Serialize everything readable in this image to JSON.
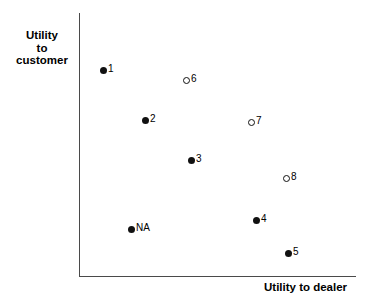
{
  "figure": {
    "background_color": "#ffffff",
    "axis_color": "#4a4a4a",
    "marker_color": "#111111",
    "width": 367,
    "height": 305
  },
  "axes": {
    "y_title_lines": [
      "Utility",
      "to",
      "customer"
    ],
    "x_title": "Utility to dealer"
  },
  "chart_data": {
    "type": "scatter",
    "title": "",
    "xlabel": "Utility to dealer",
    "ylabel": "Utility to customer",
    "xlim": [
      0,
      1
    ],
    "ylim": [
      0,
      1
    ],
    "grid": false,
    "legend": "none",
    "axis_ticks": "none",
    "note": "Axes are unlabeled/unscaled qualitative axes; x and y values are normalized 0-1 positions read off the plot area.",
    "series": [
      {
        "name": "filled",
        "marker": "filled-circle",
        "points": [
          {
            "label": "1",
            "x": 0.087,
            "y": 0.784
          },
          {
            "label": "2",
            "x": 0.238,
            "y": 0.595
          },
          {
            "label": "3",
            "x": 0.405,
            "y": 0.443
          },
          {
            "label": "4",
            "x": 0.639,
            "y": 0.216
          },
          {
            "label": "5",
            "x": 0.755,
            "y": 0.091
          },
          {
            "label": "NA",
            "x": 0.188,
            "y": 0.182
          }
        ]
      },
      {
        "name": "open",
        "marker": "open-circle",
        "points": [
          {
            "label": "6",
            "x": 0.386,
            "y": 0.746
          },
          {
            "label": "7",
            "x": 0.621,
            "y": 0.587
          },
          {
            "label": "8",
            "x": 0.747,
            "y": 0.375
          }
        ]
      }
    ],
    "points_pixels": [
      {
        "label": "1",
        "marker": "filled",
        "px": 103,
        "py": 70
      },
      {
        "label": "6",
        "marker": "open",
        "px": 186,
        "py": 80
      },
      {
        "label": "2",
        "marker": "filled",
        "px": 145,
        "py": 120
      },
      {
        "label": "7",
        "marker": "open",
        "px": 251,
        "py": 122
      },
      {
        "label": "3",
        "marker": "filled",
        "px": 191,
        "py": 160
      },
      {
        "label": "8",
        "marker": "open",
        "px": 286,
        "py": 178
      },
      {
        "label": "4",
        "marker": "filled",
        "px": 256,
        "py": 220
      },
      {
        "label": "NA",
        "marker": "filled",
        "px": 131,
        "py": 229
      },
      {
        "label": "5",
        "marker": "filled",
        "px": 288,
        "py": 253
      }
    ]
  }
}
